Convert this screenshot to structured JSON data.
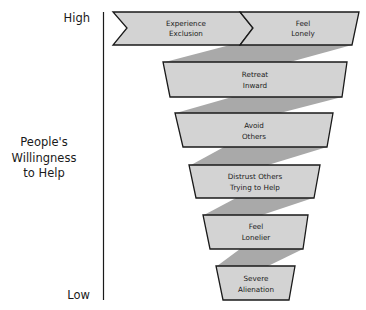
{
  "axis": {
    "high_label": "High",
    "low_label": "Low",
    "title_lines": [
      "People's",
      "Willingness",
      "to Help"
    ]
  },
  "stages": [
    {
      "lines": [
        "Experience",
        "Exclusion"
      ]
    },
    {
      "lines": [
        "Feel",
        "Lonely"
      ]
    },
    {
      "lines": [
        "Retreat",
        "Inward"
      ]
    },
    {
      "lines": [
        "Avoid",
        "Others"
      ]
    },
    {
      "lines": [
        "Distrust Others",
        "Trying to Help"
      ]
    },
    {
      "lines": [
        "Feel",
        "Lonelier"
      ]
    },
    {
      "lines": [
        "Severe",
        "Alienation"
      ]
    }
  ],
  "colors": {
    "box_fill": "#d3d3d3",
    "connector_fill": "#a9a9a9",
    "stroke": "#1a1a1a"
  }
}
